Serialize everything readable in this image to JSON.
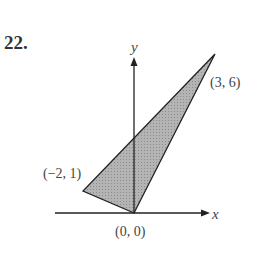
{
  "problem": {
    "number": "22."
  },
  "axes": {
    "x_label": "x",
    "y_label": "y"
  },
  "triangle": {
    "fill": "#a9a9a9",
    "vertices": [
      {
        "label": "(0, 0)",
        "x": 0,
        "y": 0
      },
      {
        "label": "(3, 6)",
        "x": 3,
        "y": 6
      },
      {
        "label": "(−2, 1)",
        "x": -2,
        "y": 1
      }
    ]
  }
}
